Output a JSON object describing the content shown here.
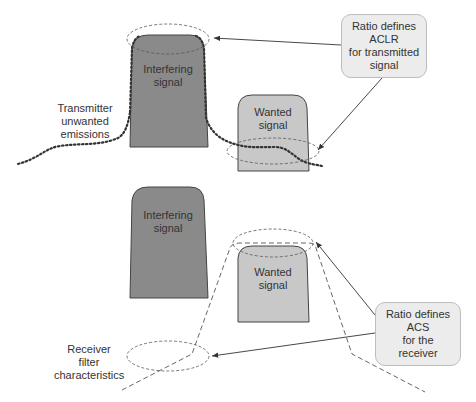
{
  "diagram": {
    "top_panel": {
      "interfering_label": [
        "Interfering",
        "signal"
      ],
      "wanted_label": [
        "Wanted",
        "signal"
      ],
      "emissions_label": [
        "Transmitter",
        "unwanted",
        "emissions"
      ],
      "callout": [
        "Ratio defines",
        "ACLR",
        "for transmitted",
        "signal"
      ]
    },
    "bottom_panel": {
      "interfering_label": [
        "Interfering",
        "signal"
      ],
      "wanted_label": [
        "Wanted",
        "signal"
      ],
      "receiver_label": [
        "Receiver",
        "filter",
        "characteristics"
      ],
      "callout": [
        "Ratio defines",
        "ACS",
        "for the",
        "receiver"
      ]
    },
    "colors": {
      "interfering_fill": "#8a8a8a",
      "wanted_fill": "#c8c8c8",
      "callout_fill": "#ececec",
      "line": "#333333"
    }
  }
}
